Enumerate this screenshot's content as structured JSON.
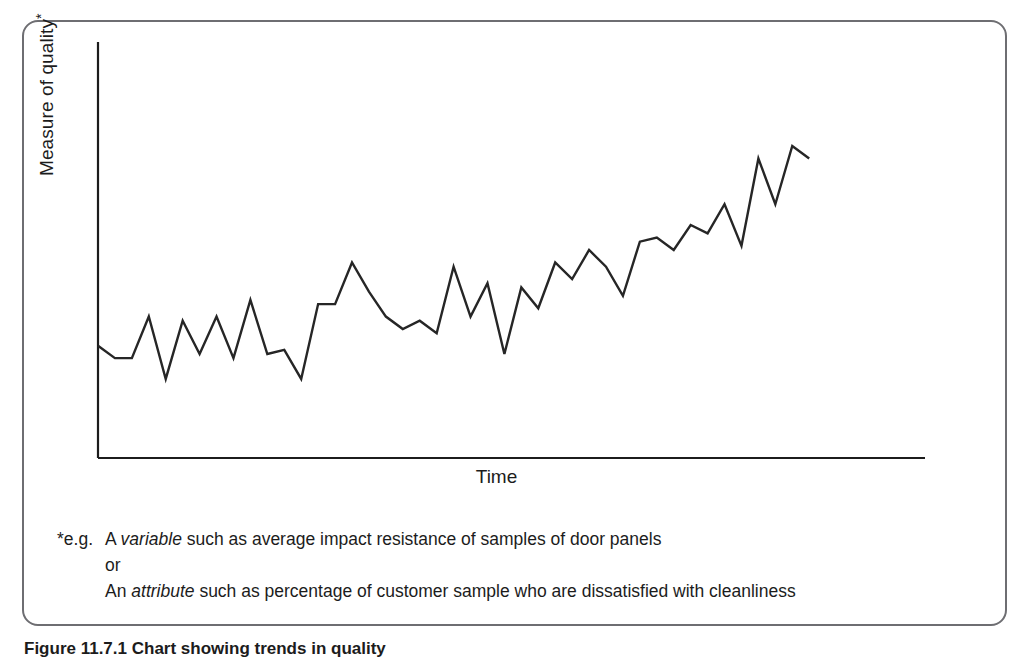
{
  "figure": {
    "caption": "Figure 11.7.1  Chart showing trends in quality",
    "frame_color": "#6e6e72",
    "line_color": "#262626",
    "axis_color": "#1c1c1c",
    "background": "#ffffff"
  },
  "axes": {
    "y_title": "Measure of quality",
    "y_title_superscript": "*",
    "x_title": "Time"
  },
  "footnote": {
    "marker": "*e.g.",
    "line1_pre": "A ",
    "line1_em": "variable",
    "line1_post": " such as average impact resistance of samples of door panels",
    "line2": "or",
    "line3_pre": "An ",
    "line3_em": "attribute",
    "line3_post": " such as percentage of customer sample who are dissatisfied with cleanliness"
  },
  "chart_data": {
    "type": "line",
    "title": "Chart showing trends in quality",
    "xlabel": "Time",
    "ylabel": "Measure of quality*",
    "grid": false,
    "legend": null,
    "axis_ticks": false,
    "xlim": [
      0,
      45
    ],
    "ylim": [
      0,
      100
    ],
    "series": [
      {
        "name": "Measure of quality",
        "color": "#262626",
        "x": [
          0,
          1,
          2,
          3,
          4,
          5,
          6,
          7,
          8,
          9,
          10,
          11,
          12,
          13,
          14,
          15,
          16,
          17,
          18,
          19,
          20,
          21,
          22,
          23,
          24,
          25,
          26,
          27,
          28,
          29,
          30,
          31,
          32,
          33,
          34,
          35,
          36,
          37,
          38,
          39,
          40,
          41,
          42
        ],
        "values": [
          27,
          24,
          24,
          34,
          19,
          33,
          25,
          34,
          24,
          38,
          25,
          26,
          19,
          37,
          37,
          47,
          40,
          34,
          31,
          33,
          30,
          46,
          34,
          42,
          25,
          41,
          36,
          47,
          43,
          50,
          46,
          39,
          52,
          53,
          50,
          56,
          54,
          61,
          51,
          72,
          61,
          75,
          72
        ]
      }
    ]
  }
}
